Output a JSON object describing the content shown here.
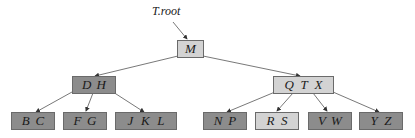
{
  "diagram": {
    "type": "b-tree",
    "root_pointer_label": "T.root",
    "colors": {
      "light_node": "#d3d3d3",
      "dark_node": "#8c8c8c",
      "border": "#6a6a6a",
      "edge": "#555555"
    },
    "nodes": {
      "root": {
        "keys": [
          "M"
        ],
        "shade": "light"
      },
      "internal_left": {
        "keys": [
          "D",
          "H"
        ],
        "shade": "dark"
      },
      "internal_right": {
        "keys": [
          "Q",
          "T",
          "X"
        ],
        "shade": "light"
      },
      "leaf_bc": {
        "keys": [
          "B",
          "C"
        ],
        "shade": "dark"
      },
      "leaf_fg": {
        "keys": [
          "F",
          "G"
        ],
        "shade": "dark"
      },
      "leaf_jkl": {
        "keys": [
          "J",
          "K",
          "L"
        ],
        "shade": "dark"
      },
      "leaf_np": {
        "keys": [
          "N",
          "P"
        ],
        "shade": "dark"
      },
      "leaf_rs": {
        "keys": [
          "R",
          "S"
        ],
        "shade": "light"
      },
      "leaf_vw": {
        "keys": [
          "V",
          "W"
        ],
        "shade": "dark"
      },
      "leaf_yz": {
        "keys": [
          "Y",
          "Z"
        ],
        "shade": "dark"
      }
    }
  }
}
